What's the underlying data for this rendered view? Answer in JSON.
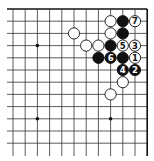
{
  "diagram": {
    "type": "go-board-partial",
    "corner": "top-right",
    "grid": {
      "origin_x": 13,
      "origin_y": 9,
      "spacing": 12.2,
      "columns": 12,
      "rows": 12,
      "line_color": "#333333",
      "edge_color": "#111111"
    },
    "star_points": [
      {
        "col": 2,
        "row": 3
      },
      {
        "col": 2,
        "row": 9
      },
      {
        "col": 8,
        "row": 9
      }
    ],
    "stones": [
      {
        "col": 8,
        "row": 1,
        "color": "white",
        "label": ""
      },
      {
        "col": 9,
        "row": 1,
        "color": "black",
        "label": ""
      },
      {
        "col": 10,
        "row": 1,
        "color": "white",
        "label": "7"
      },
      {
        "col": 5,
        "row": 2,
        "color": "white",
        "label": ""
      },
      {
        "col": 8,
        "row": 2,
        "color": "white",
        "label": ""
      },
      {
        "col": 9,
        "row": 2,
        "color": "black",
        "label": ""
      },
      {
        "col": 6,
        "row": 3,
        "color": "white",
        "label": ""
      },
      {
        "col": 7,
        "row": 3,
        "color": "white",
        "label": ""
      },
      {
        "col": 8,
        "row": 3,
        "color": "black",
        "label": ""
      },
      {
        "col": 9,
        "row": 3,
        "color": "white",
        "label": "5"
      },
      {
        "col": 10,
        "row": 3,
        "color": "white",
        "label": "3"
      },
      {
        "col": 7,
        "row": 4,
        "color": "black",
        "label": ""
      },
      {
        "col": 8,
        "row": 4,
        "color": "black",
        "label": "6"
      },
      {
        "col": 9,
        "row": 4,
        "color": "black",
        "label": ""
      },
      {
        "col": 10,
        "row": 4,
        "color": "white",
        "label": "1"
      },
      {
        "col": 9,
        "row": 5,
        "color": "black",
        "label": "4"
      },
      {
        "col": 10,
        "row": 5,
        "color": "black",
        "label": "2"
      },
      {
        "col": 9,
        "row": 6,
        "color": "white",
        "label": ""
      },
      {
        "col": 8,
        "row": 7,
        "color": "white",
        "label": ""
      }
    ]
  }
}
